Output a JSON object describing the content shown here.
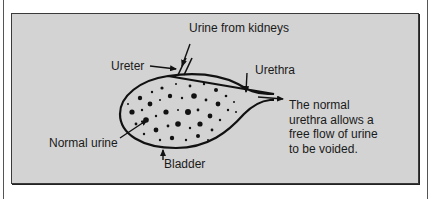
{
  "diagram": {
    "type": "anatomy-illustration",
    "subject": "bladder",
    "background_color": "#d3d3d3",
    "border_color": "#3a3a3a",
    "labels": {
      "urine_from_kidneys": "Urine from kidneys",
      "ureter": "Ureter",
      "urethra": "Urethra",
      "normal_urine": "Normal urine",
      "bladder": "Bladder"
    },
    "caption_lines": [
      "The normal",
      "urethra allows a",
      "free flow of urine",
      "to be voided."
    ]
  }
}
